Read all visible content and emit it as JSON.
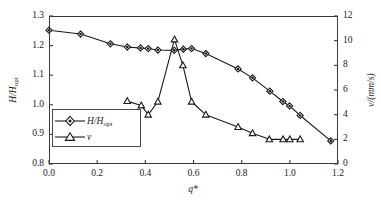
{
  "chart_data": {
    "type": "line",
    "title": "",
    "xlabel": "q*",
    "ylabel": "H/Hopt",
    "ylabel_right": "v/(mm/s)",
    "xlim": [
      0.0,
      1.2
    ],
    "ylim": [
      0.8,
      1.3
    ],
    "ylim_right": [
      0,
      12
    ],
    "grid": false,
    "legend_position": "inside-lower-left",
    "xticks": [
      "0.0",
      "0.2",
      "0.4",
      "0.6",
      "0.8",
      "1.0",
      "1.2"
    ],
    "xtick_values": [
      0.0,
      0.2,
      0.4,
      0.6,
      0.8,
      1.0,
      1.2
    ],
    "yticks_left": [
      "0.8",
      "0.9",
      "1.0",
      "1.1",
      "1.2",
      "1.3"
    ],
    "ytick_values_left": [
      0.8,
      0.9,
      1.0,
      1.1,
      1.2,
      1.3
    ],
    "yticks_right": [
      "0",
      "2",
      "4",
      "6",
      "8",
      "10",
      "12"
    ],
    "ytick_values_right": [
      0,
      2,
      4,
      6,
      8,
      10,
      12
    ],
    "series": [
      {
        "name": "H/Hopt",
        "legend_label": "H/Hopt",
        "marker": "diamond",
        "axis": "left",
        "color": "#1a1a1a",
        "points": [
          [
            0.0,
            1.252
          ],
          [
            0.131,
            1.239
          ],
          [
            0.255,
            1.206
          ],
          [
            0.325,
            1.195
          ],
          [
            0.38,
            1.192
          ],
          [
            0.412,
            1.19
          ],
          [
            0.452,
            1.185
          ],
          [
            0.52,
            1.184
          ],
          [
            0.558,
            1.188
          ],
          [
            0.592,
            1.19
          ],
          [
            0.651,
            1.173
          ],
          [
            0.785,
            1.121
          ],
          [
            0.845,
            1.091
          ],
          [
            0.917,
            1.046
          ],
          [
            0.971,
            1.011
          ],
          [
            0.999,
            0.996
          ],
          [
            1.043,
            0.964
          ],
          [
            1.17,
            0.878
          ]
        ]
      },
      {
        "name": "v",
        "legend_label": "v",
        "marker": "triangle",
        "axis": "right",
        "color": "#1a1a1a",
        "points": [
          [
            0.325,
            5.1
          ],
          [
            0.383,
            4.75
          ],
          [
            0.412,
            4.0
          ],
          [
            0.452,
            5.05
          ],
          [
            0.521,
            10.1
          ],
          [
            0.556,
            8.0
          ],
          [
            0.592,
            5.05
          ],
          [
            0.651,
            4.0
          ],
          [
            0.785,
            3.0
          ],
          [
            0.845,
            2.5
          ],
          [
            0.915,
            2.0
          ],
          [
            0.972,
            2.0
          ],
          [
            1.0,
            2.0
          ],
          [
            1.043,
            2.0
          ]
        ]
      }
    ]
  },
  "axes": {
    "x_title": "q*",
    "y_left_title_main": "H/H",
    "y_left_title_sub": "opt",
    "y_right_title": "v/(mm/s)"
  },
  "legend": {
    "items": [
      {
        "label_main": "H/H",
        "label_sub": "opt",
        "marker": "diamond"
      },
      {
        "label_main": "v",
        "label_sub": "",
        "marker": "triangle"
      }
    ]
  },
  "colors": {
    "axis": "#3a3a3a",
    "line": "#1a1a1a",
    "marker_fill": "#ffffff",
    "background": "#ffffff"
  }
}
